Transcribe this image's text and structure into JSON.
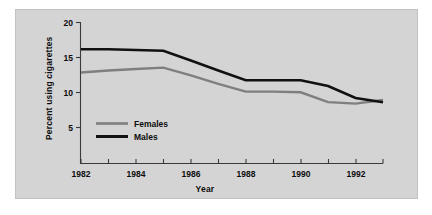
{
  "figure": {
    "background_color": "#ffffff",
    "panel_color": "#d4d4d4",
    "panel_border_color": "#c2c2c2"
  },
  "chart_data": {
    "type": "line",
    "title": "",
    "xlabel": "Year",
    "ylabel": "Percent using cigarettes",
    "x": [
      1982,
      1983,
      1984,
      1985,
      1986,
      1987,
      1988,
      1989,
      1990,
      1991,
      1992,
      1993
    ],
    "xlim": [
      1982,
      1993
    ],
    "ylim": [
      0,
      20
    ],
    "yticks": [
      5,
      10,
      15,
      20
    ],
    "ytick_labels": [
      "5",
      "10",
      "15",
      "20"
    ],
    "xticks": [
      1982,
      1983,
      1984,
      1985,
      1986,
      1987,
      1988,
      1989,
      1990,
      1991,
      1992,
      1993
    ],
    "xtick_labels_major": [
      "1982",
      "1984",
      "1986",
      "1988",
      "1990",
      "1992"
    ],
    "xticks_major": [
      1982,
      1984,
      1986,
      1988,
      1990,
      1992
    ],
    "grid": false,
    "legend_position": "inside-left",
    "series": [
      {
        "name": "Males",
        "color": "#111111",
        "linewidth": 2.6,
        "values": [
          16.2,
          16.2,
          16.1,
          16.0,
          14.6,
          13.2,
          11.8,
          11.8,
          11.8,
          11.0,
          9.3,
          8.7
        ]
      },
      {
        "name": "Females",
        "color": "#7f7f7f",
        "linewidth": 2.4,
        "values": [
          12.9,
          13.2,
          13.4,
          13.6,
          12.5,
          11.3,
          10.2,
          10.2,
          10.1,
          8.7,
          8.5,
          9.0
        ]
      }
    ]
  },
  "legend": {
    "entries": [
      {
        "label": "Females",
        "color": "#7f7f7f"
      },
      {
        "label": "Males",
        "color": "#111111"
      }
    ]
  },
  "axes": {
    "y_axis_title": "Percent using cigarettes",
    "x_axis_title": "Year",
    "y_tick_20": "20",
    "y_tick_15": "15",
    "y_tick_10": "10",
    "y_tick_5": "5",
    "x_tick_1982": "1982",
    "x_tick_1984": "1984",
    "x_tick_1986": "1986",
    "x_tick_1988": "1988",
    "x_tick_1990": "1990",
    "x_tick_1992": "1992"
  }
}
